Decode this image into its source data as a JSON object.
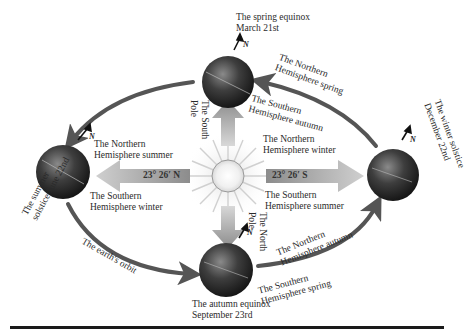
{
  "diagram": {
    "sun": {
      "label": "sun",
      "color": "#e8e8e8"
    },
    "positions": [
      {
        "id": "spring",
        "event": "The spring equinox",
        "date": "March 21st"
      },
      {
        "id": "summer",
        "event": "The summer solstice June 22nd"
      },
      {
        "id": "winter",
        "event": "The winter solstice",
        "date": "December 22nd"
      },
      {
        "id": "autumn",
        "event": "The autumn equinox",
        "date": "September 23rd"
      }
    ],
    "hemisphere_labels": {
      "north_spring_1": "The Northern",
      "north_spring_2": "Hemisphere spring",
      "south_autumn_1": "The Southern",
      "south_autumn_2": "Hemisphere autumn",
      "north_summer_1": "The Northern",
      "north_summer_2": "Hemisphere summer",
      "south_winter_1": "The Southern",
      "south_winter_2": "Hemisphere winter",
      "north_winter_1": "The Northern",
      "north_winter_2": "Hemisphere winter",
      "south_summer_1": "The Southern",
      "south_summer_2": "Hemisphere summer",
      "north_autumn_1": "The Northern",
      "north_autumn_2": "Hemisphere autumn",
      "south_spring_1": "The Southern",
      "south_spring_2": "Hemisphere spring"
    },
    "poles": {
      "south_1": "The South",
      "south_2": "Pole",
      "north_1": "The North",
      "north_2": "Pole"
    },
    "angles": {
      "north": "23° 26′ N",
      "south": "23° 26′ S"
    },
    "north_marker": "N",
    "orbit_label": "The earth's orbit",
    "summer_label_1": "The summer",
    "summer_label_2": "solstice June 22nd",
    "winter_label_1": "The winter solstice",
    "winter_label_2": "December 22nd",
    "colors": {
      "orbit": "#555555",
      "globe": "#2e2e2e",
      "ray_arrow": "#9a9a9a",
      "rule": "#1a1a1a"
    }
  }
}
